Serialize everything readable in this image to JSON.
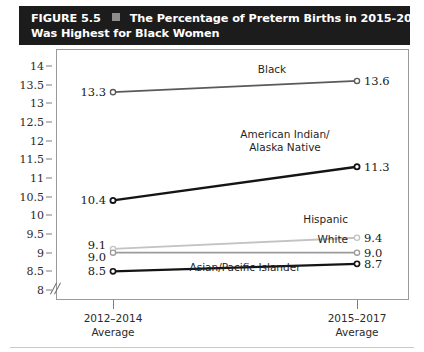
{
  "figure": {
    "number_label": "FIGURE 5.5",
    "bullet_icon": "square-bullet-icon",
    "title_line_1": "The Percentage of Preterm Births in 2015-2017",
    "title_line_2": "Was Highest for Black Women",
    "title_bar_color": "#1c1c1c",
    "bullet_color": "#8d8d8d"
  },
  "chart_data": {
    "type": "line",
    "title": "The Percentage of Preterm Births in 2015-2017 Was Highest for Black Women",
    "xlabel": "",
    "ylabel": "",
    "categories": [
      "2012–2014\nAverage",
      "2015–2017\nAverage"
    ],
    "x_tick_labels": [
      {
        "line1": "2012–2014",
        "line2": "Average"
      },
      {
        "line1": "2015–2017",
        "line2": "Average"
      }
    ],
    "ylim": [
      8,
      14
    ],
    "y_ticks": [
      14,
      13.5,
      13,
      12.5,
      12,
      11.5,
      11,
      10.5,
      10,
      9.5,
      9,
      8.5,
      8
    ],
    "y_tick_labels": [
      "14",
      "13.5",
      "13",
      "12.5",
      "12",
      "11.5",
      "11",
      "10.5",
      "10",
      "9.5",
      "9",
      "8.5",
      "8"
    ],
    "axis_break": true,
    "grid": false,
    "legend": "inline-labels",
    "series": [
      {
        "name": "Black",
        "label": "Black",
        "values": [
          13.3,
          13.6
        ],
        "value_labels": [
          "13.3",
          "13.6"
        ],
        "color": "#5a5a5a",
        "width": 1.8
      },
      {
        "name": "American Indian/Alaska Native",
        "label_line_1": "American Indian/",
        "label_line_2": "Alaska Native",
        "values": [
          10.4,
          11.3
        ],
        "value_labels": [
          "10.4",
          "11.3"
        ],
        "color": "#141414",
        "width": 2.4
      },
      {
        "name": "Hispanic",
        "label": "Hispanic",
        "values": [
          9.1,
          9.4
        ],
        "value_labels": [
          "9.1",
          "9.4"
        ],
        "color": "#c3c3c3",
        "width": 1.8
      },
      {
        "name": "White",
        "label": "White",
        "values": [
          9.0,
          9.0
        ],
        "value_labels": [
          "9.0",
          "9.0"
        ],
        "color": "#9b9b9b",
        "width": 1.6
      },
      {
        "name": "Asian/Pacific Islander",
        "label": "Asian/Pacific Islander",
        "values": [
          8.5,
          8.7
        ],
        "value_labels": [
          "8.5",
          "8.7"
        ],
        "color": "#141414",
        "width": 2.2
      }
    ]
  }
}
